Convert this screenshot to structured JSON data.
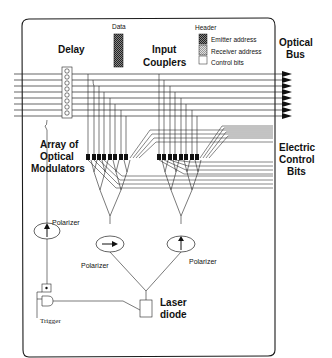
{
  "labels": {
    "delay": "Delay",
    "data": "Data",
    "header": "Header",
    "input_couplers_1": "Input",
    "input_couplers_2": "Couplers",
    "optical_bus_1": "Optical",
    "optical_bus_2": "Bus",
    "array_1": "Array of",
    "array_2": "Optical",
    "array_3": "Modulators",
    "electric_1": "Electric",
    "electric_2": "Control",
    "electric_3": "Bits",
    "polarizer_left": "Polarizer",
    "polarizer_mid": "Polarizer",
    "polarizer_right": "Polarizer",
    "trigger": "Trigger",
    "laser_1": "Laser",
    "laser_2": "diode"
  },
  "legend": {
    "items": [
      {
        "label": "Emitter address",
        "pattern": "dark-hatch"
      },
      {
        "label": "Receiver address",
        "pattern": "light-hatch"
      },
      {
        "label": "Control bits",
        "pattern": "blank"
      }
    ]
  },
  "colors": {
    "line": "#222222",
    "background": "#ffffff",
    "modulator": "#111111"
  },
  "structure": {
    "bus_lines": 8,
    "delay_elements": 8,
    "modulators_per_group": 8,
    "modulator_groups": 2,
    "polarizers": 3
  }
}
